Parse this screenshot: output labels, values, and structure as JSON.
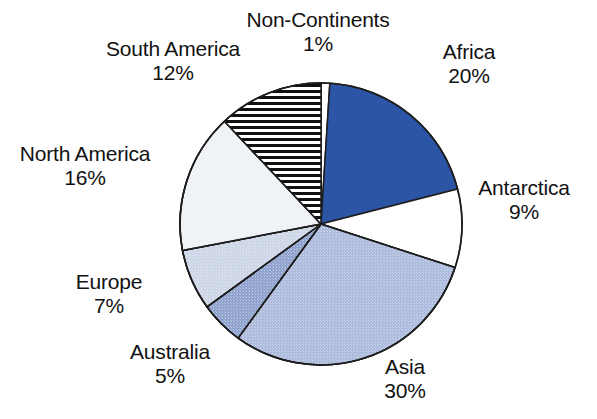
{
  "chart_data": {
    "type": "pie",
    "title": "",
    "subtitle": "",
    "xlabel": "",
    "ylabel": "",
    "legend_position": "none",
    "grid": false,
    "units": "percent",
    "start_angle_deg": 0,
    "direction": "clockwise",
    "categories": [
      "Non-Continents",
      "Africa",
      "Antarctica",
      "Asia",
      "Australia",
      "Europe",
      "North America",
      "South America"
    ],
    "values": [
      1,
      20,
      9,
      30,
      5,
      7,
      16,
      12
    ],
    "labels": [
      "1%",
      "20%",
      "9%",
      "30%",
      "5%",
      "7%",
      "16%",
      "12%"
    ],
    "slices": [
      {
        "name": "Non-Continents",
        "value": 1,
        "value_label": "1%",
        "fill": "#ffffff",
        "pattern": "solid",
        "stroke": "#1d1d1d",
        "label_x": 318,
        "label_y": 8,
        "label_align": "center"
      },
      {
        "name": "Africa",
        "value": 20,
        "value_label": "20%",
        "fill": "#2c55a5",
        "pattern": "solid",
        "stroke": "#1d1d1d",
        "label_x": 469,
        "label_y": 40,
        "label_align": "center"
      },
      {
        "name": "Antarctica",
        "value": 9,
        "value_label": "9%",
        "fill": "#ffffff",
        "pattern": "solid",
        "stroke": "#1d1d1d",
        "label_x": 524,
        "label_y": 176,
        "label_align": "center"
      },
      {
        "name": "Asia",
        "value": 30,
        "value_label": "30%",
        "fill": "#adbbdd",
        "pattern": "dither",
        "stroke": "#1d1d1d",
        "label_x": 405,
        "label_y": 355,
        "label_align": "center"
      },
      {
        "name": "Australia",
        "value": 5,
        "value_label": "5%",
        "fill": "#8fa3ce",
        "pattern": "dither",
        "stroke": "#1d1d1d",
        "label_x": 170,
        "label_y": 340,
        "label_align": "center"
      },
      {
        "name": "Europe",
        "value": 7,
        "value_label": "7%",
        "fill": "#ccd6e6",
        "pattern": "dither",
        "stroke": "#1d1d1d",
        "label_x": 109,
        "label_y": 270,
        "label_align": "center"
      },
      {
        "name": "North America",
        "value": 16,
        "value_label": "16%",
        "fill": "#eef2f7",
        "pattern": "dither",
        "stroke": "#1d1d1d",
        "label_x": 85,
        "label_y": 142,
        "label_align": "center"
      },
      {
        "name": "South America",
        "value": 12,
        "value_label": "12%",
        "fill": "#ffffff",
        "pattern": "horizontal-stripes",
        "stroke": "#1d1d1d",
        "label_x": 173,
        "label_y": 37,
        "label_align": "center"
      }
    ],
    "geometry": {
      "center_x": 321,
      "center_y": 224,
      "radius": 141
    },
    "colors": {
      "outline": "#1d1d1d",
      "background": "#ffffff",
      "text": "#121212",
      "accent": "#2c55a5"
    }
  }
}
